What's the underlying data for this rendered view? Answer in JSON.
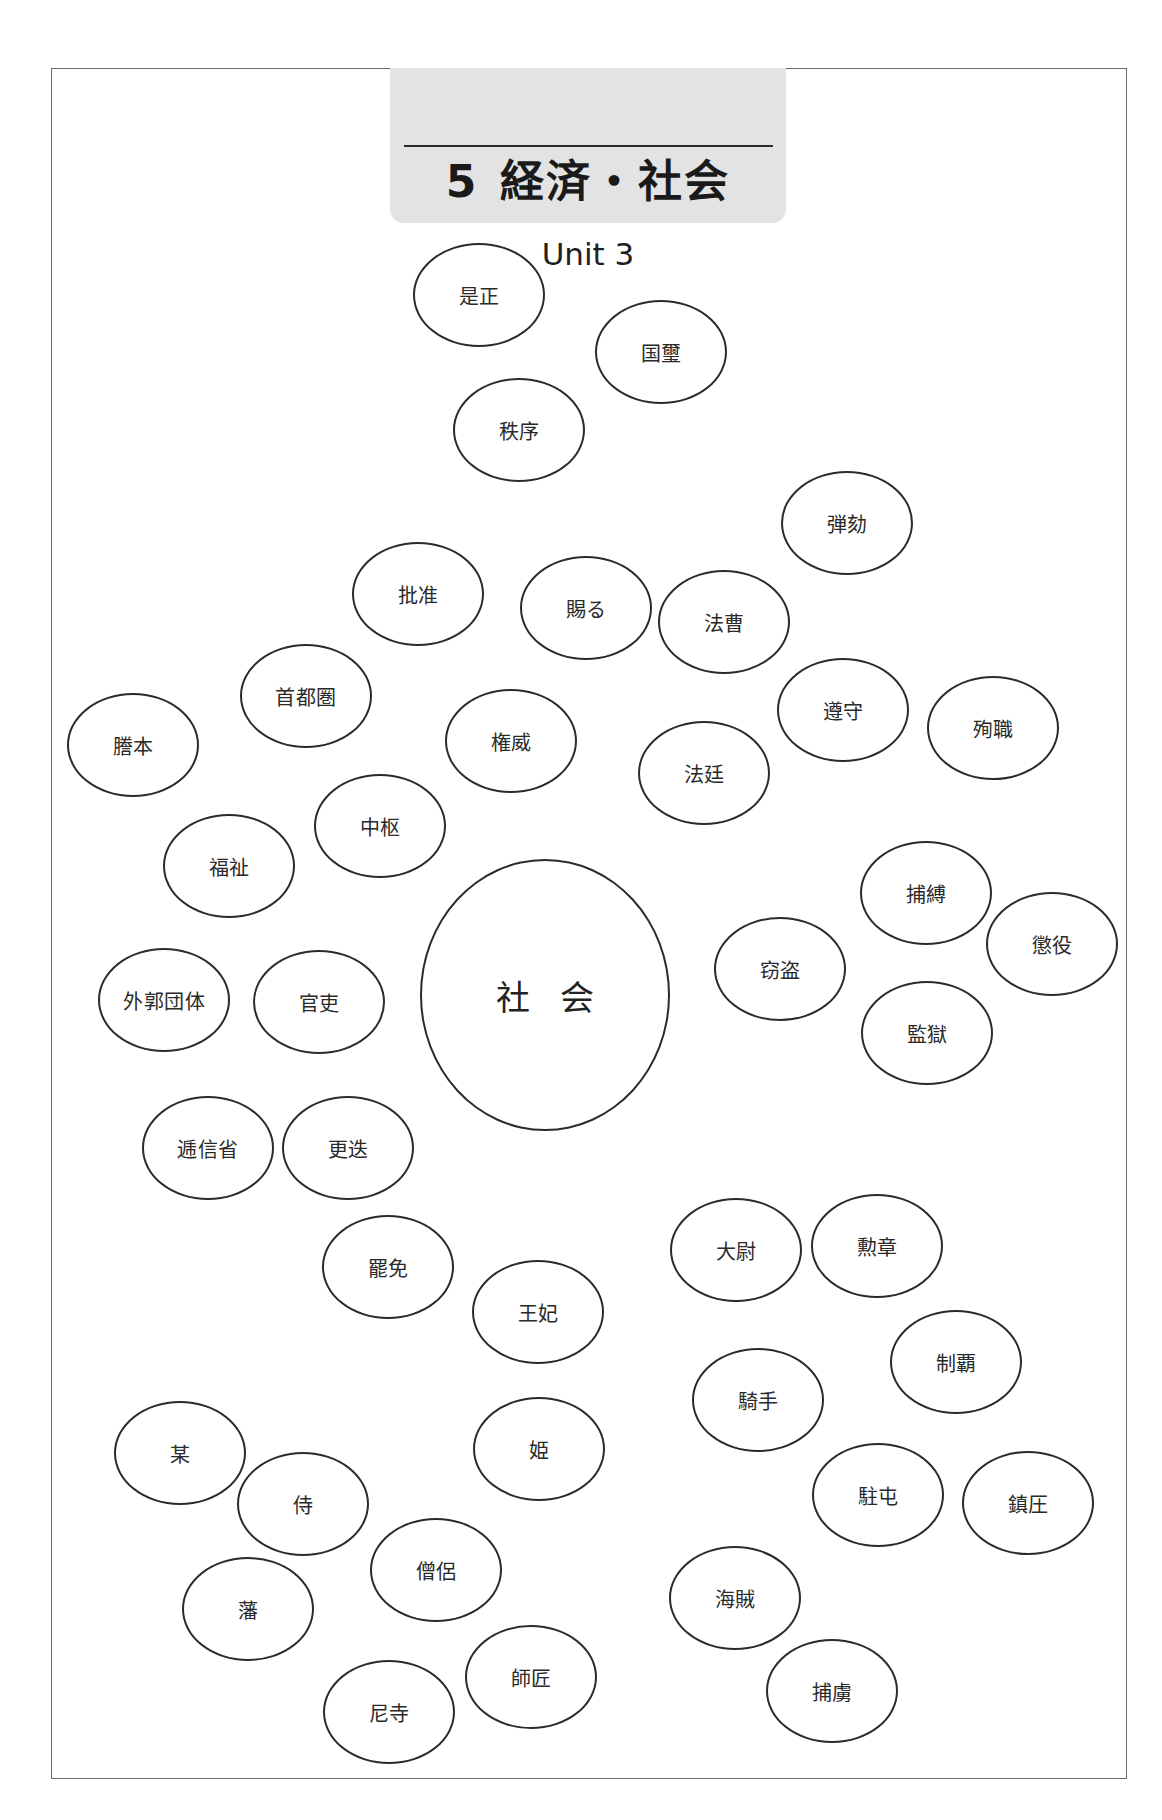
{
  "header": {
    "chapter_number": "5",
    "chapter_title": "経済・社会",
    "unit": "Unit 3"
  },
  "center": {
    "label": "社 会",
    "cx": 545,
    "cy": 995,
    "w": 250,
    "h": 272
  },
  "bubbles": [
    {
      "label": "是正",
      "cx": 479,
      "cy": 295
    },
    {
      "label": "国璽",
      "cx": 661,
      "cy": 352
    },
    {
      "label": "秩序",
      "cx": 519,
      "cy": 430
    },
    {
      "label": "弾劾",
      "cx": 847,
      "cy": 523
    },
    {
      "label": "批准",
      "cx": 418,
      "cy": 594
    },
    {
      "label": "賜る",
      "cx": 586,
      "cy": 608
    },
    {
      "label": "法曹",
      "cx": 724,
      "cy": 622
    },
    {
      "label": "首都圏",
      "cx": 306,
      "cy": 696
    },
    {
      "label": "謄本",
      "cx": 133,
      "cy": 745
    },
    {
      "label": "権威",
      "cx": 511,
      "cy": 741
    },
    {
      "label": "遵守",
      "cx": 843,
      "cy": 710
    },
    {
      "label": "殉職",
      "cx": 993,
      "cy": 728
    },
    {
      "label": "法廷",
      "cx": 704,
      "cy": 773
    },
    {
      "label": "中枢",
      "cx": 380,
      "cy": 826
    },
    {
      "label": "福祉",
      "cx": 229,
      "cy": 866
    },
    {
      "label": "捕縛",
      "cx": 926,
      "cy": 893
    },
    {
      "label": "懲役",
      "cx": 1052,
      "cy": 944
    },
    {
      "label": "窃盗",
      "cx": 780,
      "cy": 969
    },
    {
      "label": "外郭団体",
      "cx": 164,
      "cy": 1000
    },
    {
      "label": "官吏",
      "cx": 319,
      "cy": 1002
    },
    {
      "label": "監獄",
      "cx": 927,
      "cy": 1033
    },
    {
      "label": "逓信省",
      "cx": 208,
      "cy": 1148
    },
    {
      "label": "更迭",
      "cx": 348,
      "cy": 1148
    },
    {
      "label": "罷免",
      "cx": 388,
      "cy": 1267
    },
    {
      "label": "大尉",
      "cx": 736,
      "cy": 1250
    },
    {
      "label": "勲章",
      "cx": 877,
      "cy": 1246
    },
    {
      "label": "王妃",
      "cx": 538,
      "cy": 1312
    },
    {
      "label": "制覇",
      "cx": 956,
      "cy": 1362
    },
    {
      "label": "騎手",
      "cx": 758,
      "cy": 1400
    },
    {
      "label": "某",
      "cx": 180,
      "cy": 1453
    },
    {
      "label": "姫",
      "cx": 539,
      "cy": 1449
    },
    {
      "label": "侍",
      "cx": 303,
      "cy": 1504
    },
    {
      "label": "駐屯",
      "cx": 878,
      "cy": 1495
    },
    {
      "label": "鎮圧",
      "cx": 1028,
      "cy": 1503
    },
    {
      "label": "僧侶",
      "cx": 436,
      "cy": 1570
    },
    {
      "label": "海賊",
      "cx": 735,
      "cy": 1598
    },
    {
      "label": "藩",
      "cx": 248,
      "cy": 1609
    },
    {
      "label": "師匠",
      "cx": 531,
      "cy": 1677
    },
    {
      "label": "捕虜",
      "cx": 832,
      "cy": 1691
    },
    {
      "label": "尼寺",
      "cx": 389,
      "cy": 1712
    }
  ]
}
